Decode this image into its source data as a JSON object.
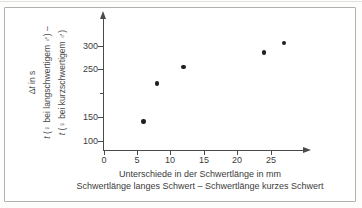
{
  "figure": {
    "background": "#ffffff",
    "border_color": "#b2b2ae"
  },
  "chart_data": {
    "type": "scatter",
    "title": "",
    "points": [
      {
        "x": 6,
        "y": 140
      },
      {
        "x": 8,
        "y": 220
      },
      {
        "x": 12,
        "y": 255
      },
      {
        "x": 24,
        "y": 285
      },
      {
        "x": 27,
        "y": 305
      }
    ],
    "x_ticks": [
      {
        "value": 0,
        "label": "0"
      },
      {
        "value": 5,
        "label": "5"
      },
      {
        "value": 10,
        "label": "10"
      },
      {
        "value": 15,
        "label": "15"
      },
      {
        "value": 20,
        "label": "20"
      },
      {
        "value": 25,
        "label": "25"
      }
    ],
    "y_ticks": [
      {
        "value": 100,
        "label": "100"
      },
      {
        "value": 150,
        "label": "150"
      },
      {
        "value": 200,
        "label": ""
      },
      {
        "value": 250,
        "label": "250"
      },
      {
        "value": 300,
        "label": "300"
      }
    ],
    "xlim": [
      0,
      30
    ],
    "ylim": [
      100,
      350
    ],
    "grid": false,
    "legend": null,
    "axis_color": "#4a4a4a",
    "point_color": "#1f1f1f",
    "ylabel_lines": [
      "Δt in s",
      "t (♀ bei langschwertigem ♂) –",
      "t (♀ bei kurzschwertigem ♂)"
    ],
    "xlabel_lines": [
      "Unterschiede in der Schwertlänge in mm",
      "Schwertlänge langes Schwert – Schwertlänge kurzes Schwert"
    ]
  }
}
